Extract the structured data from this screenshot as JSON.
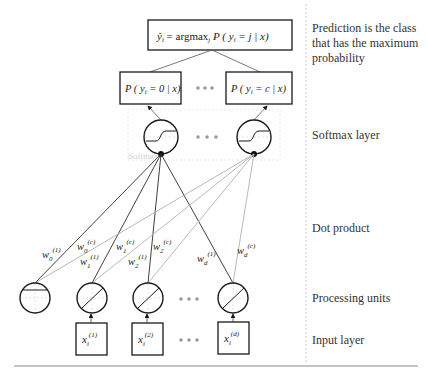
{
  "diagram": {
    "colors": {
      "stroke": "#1a1a1a",
      "light_line": "#aaaaaa",
      "dots": "#9a9a9a",
      "text": "#333333",
      "faint": "#d0d0d0"
    },
    "output": {
      "formula_lhs": "ŷ",
      "formula_sub": "i",
      "formula_eq": " = argmax",
      "formula_sub2": "j",
      "formula_rhs": " P ( y",
      "formula_sub3": "i",
      "formula_end": " = j | x)"
    },
    "probabilities": [
      {
        "label_pre": "P ( y",
        "sub": "i",
        "label_post": " = 0 | x)"
      },
      {
        "label_pre": "P ( y",
        "sub": "i",
        "label_post": " = c | x)"
      }
    ],
    "ellipsis": "• • •",
    "softmax_label": "Softmax",
    "weights": [
      {
        "base": "w",
        "sub": "0",
        "sup": "(1)"
      },
      {
        "base": "w",
        "sub": "0",
        "sup": "(c)"
      },
      {
        "base": "w",
        "sub": "1",
        "sup": "(c)"
      },
      {
        "base": "w",
        "sub": "1",
        "sup": "(1)"
      },
      {
        "base": "w",
        "sub": "2",
        "sup": "(1)"
      },
      {
        "base": "w",
        "sub": "2",
        "sup": "(c)"
      },
      {
        "base": "w",
        "sub": "d",
        "sup": "(1)"
      },
      {
        "base": "w",
        "sub": "d",
        "sup": "(c)"
      }
    ],
    "inputs": [
      {
        "base": "x",
        "sub": "i",
        "sup": "(1)"
      },
      {
        "base": "x",
        "sub": "i",
        "sup": "(2)"
      },
      {
        "base": "x",
        "sub": "i",
        "sup": "(d)"
      }
    ]
  },
  "annotations": {
    "prediction": [
      "Prediction is the class",
      "that has the maximum",
      "probability"
    ],
    "softmax_layer": "Softmax layer",
    "dot_product": "Dot product",
    "processing_units": "Processing units",
    "input_layer": "Input layer"
  }
}
